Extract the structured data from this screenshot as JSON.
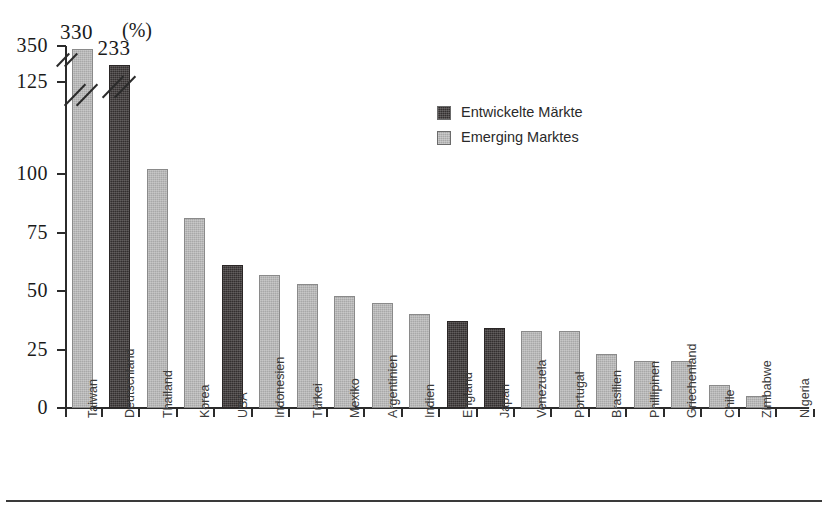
{
  "chart_data": {
    "type": "bar",
    "title": "",
    "subtitle": "",
    "unit_label": "(%)",
    "xlabel": "",
    "ylabel": "",
    "ylim": [
      0,
      125
    ],
    "grid": false,
    "axis_break": {
      "present": true,
      "below": 125,
      "above": 350,
      "note": "y-axis broken between 125 and 350"
    },
    "y_ticks": [
      {
        "value": 350,
        "label": "350"
      },
      {
        "value": 125,
        "label": "125"
      },
      {
        "value": 100,
        "label": "100"
      },
      {
        "value": 75,
        "label": "75"
      },
      {
        "value": 50,
        "label": "50"
      },
      {
        "value": 25,
        "label": "25"
      },
      {
        "value": 0,
        "label": "0"
      }
    ],
    "categories": [
      "Taiwan",
      "Deutschland",
      "Thailand",
      "Korea",
      "USA",
      "Indonesien",
      "Türkei",
      "Mexiko",
      "Argentinien",
      "Indien",
      "England",
      "Japan",
      "Venezuela",
      "Portugal",
      "Brasilien",
      "Phillipinen",
      "Griechenland",
      "Chile",
      "Zimbabwe",
      "Nigeria"
    ],
    "values": [
      330,
      233,
      102,
      81,
      61,
      57,
      53,
      48,
      45,
      40,
      37,
      34,
      33,
      33,
      23,
      20,
      20,
      10,
      5,
      0
    ],
    "series_of_bar": [
      "Emerging Marktes",
      "Entwickelte Märkte",
      "Emerging Marktes",
      "Emerging Marktes",
      "Entwickelte Märkte",
      "Emerging Marktes",
      "Emerging Marktes",
      "Emerging Marktes",
      "Emerging Marktes",
      "Emerging Marktes",
      "Entwickelte Märkte",
      "Entwickelte Märkte",
      "Emerging Marktes",
      "Emerging Marktes",
      "Emerging Marktes",
      "Emerging Marktes",
      "Emerging Marktes",
      "Emerging Marktes",
      "Emerging Marktes",
      "Emerging Marktes"
    ],
    "data_labels": [
      {
        "category": "Taiwan",
        "text": "330"
      },
      {
        "category": "Deutschland",
        "text": "233"
      }
    ],
    "legend": {
      "position": "upper-center-right",
      "entries": [
        {
          "label": "Entwickelte Märkte",
          "color": "#332f2f",
          "key": "developed"
        },
        {
          "label": "Emerging Marktes",
          "color": "#a8a8a8",
          "key": "emerging"
        }
      ]
    },
    "colors": {
      "developed": "#332f2f",
      "emerging": "#a8a8a8",
      "axis": "#2b2b2b",
      "background": "#ffffff",
      "text": "#1a1a1a"
    }
  },
  "footer": {
    "rule": true,
    "caption": ""
  }
}
